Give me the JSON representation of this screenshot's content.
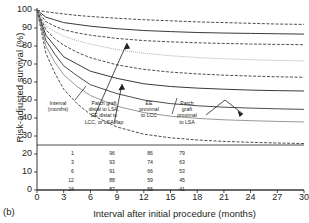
{
  "figure": {
    "panel_letter": "(b)",
    "xlabel": "Interval after initial procedure (months)",
    "ylabel": "Risk-adjusted survival (%)"
  },
  "annotations": {
    "interval_header": "Interval\n(months)",
    "group1": "Patch graft\ndistal to LSA,\nEE distal to\nLCC, or LSA flap",
    "group2": "EE\nproximal\nto LCC",
    "group3": "Patch\ngraft\nproximal\nto LSA"
  },
  "table": {
    "row_labels": [
      "1",
      "3",
      "6",
      "12",
      "24"
    ],
    "columns": [
      {
        "name": "Patch graft distal to LSA, EE distal to LCC, or LSA flap",
        "values": [
          "96",
          "93",
          "91",
          "88",
          "87"
        ]
      },
      {
        "name": "EE proximal to LCC",
        "values": [
          "86",
          "74",
          "66",
          "59",
          "56"
        ]
      },
      {
        "name": "Patch graft proximal to LSA",
        "values": [
          "79",
          "63",
          "53",
          "45",
          "41"
        ]
      }
    ]
  },
  "chart_data": {
    "type": "line",
    "title": "",
    "xlabel": "Interval after initial procedure (months)",
    "ylabel": "Risk-adjusted survival (%)",
    "xlim": [
      0,
      30
    ],
    "ylim": [
      0,
      100
    ],
    "xticks": [
      0,
      3,
      6,
      9,
      12,
      15,
      18,
      21,
      24,
      27,
      30
    ],
    "yticks": [
      0,
      10,
      20,
      30,
      40,
      50,
      60,
      70,
      80,
      90,
      100
    ],
    "grid": false,
    "legend": "in-plot annotations with arrows",
    "x": [
      0,
      1,
      2,
      3,
      4.5,
      6,
      9,
      12,
      15,
      18,
      21,
      24,
      27,
      30
    ],
    "series": [
      {
        "name": "Patch graft distal to LSA, EE distal to LCC, or LSA flap - upper CI",
        "style": "dashed",
        "color": "#4d4d4d",
        "values": [
          100,
          99,
          98.4,
          97.8,
          97.0,
          96.4,
          95.4,
          94.6,
          94.0,
          93.4,
          93.0,
          92.6,
          92.2,
          92.0
        ]
      },
      {
        "name": "Patch graft distal to LSA, EE distal to LCC, or LSA flap - estimate",
        "style": "solid",
        "color": "#3a3a3a",
        "values": [
          100,
          96,
          94.5,
          93,
          92,
          91,
          89.6,
          88.6,
          88.0,
          87.5,
          87.2,
          87.0,
          86.8,
          86.6
        ]
      },
      {
        "name": "Patch graft distal to LSA, EE distal to LCC, or LSA flap - lower CI",
        "style": "dashed",
        "color": "#4d4d4d",
        "values": [
          100,
          93.5,
          91,
          89,
          87.3,
          86,
          84.2,
          83.0,
          82.3,
          81.8,
          81.4,
          81.1,
          80.9,
          80.7
        ]
      },
      {
        "name": "Secondary upper band - dotted",
        "style": "dotted",
        "color": "#8c8c8c",
        "values": [
          100,
          91,
          88,
          85.5,
          83,
          81,
          78,
          76,
          74.6,
          73.6,
          72.9,
          72.4,
          72.0,
          71.7
        ]
      },
      {
        "name": "EE proximal to LCC - upper CI",
        "style": "dashed",
        "color": "#4d4d4d",
        "values": [
          100,
          89,
          84,
          80.5,
          76.5,
          73.5,
          69.5,
          67,
          65.5,
          64.5,
          63.8,
          63.3,
          62.9,
          62.6
        ]
      },
      {
        "name": "EE proximal to LCC - estimate",
        "style": "solid",
        "color": "#3a3a3a",
        "values": [
          100,
          86,
          80,
          74,
          70,
          66,
          62,
          59,
          57.5,
          56.6,
          56.0,
          55.5,
          55.2,
          55.0
        ]
      },
      {
        "name": "EE proximal to LCC - lower CI",
        "style": "solid",
        "color": "#4d4d4d",
        "values": [
          100,
          83,
          75.5,
          69,
          63.5,
          58.5,
          53.5,
          50,
          48,
          46.8,
          46.0,
          45.5,
          45.1,
          44.8
        ]
      },
      {
        "name": "Patch graft proximal to LSA - upper band",
        "style": "solid",
        "color": "#999999",
        "values": [
          100,
          80,
          71,
          64,
          57.5,
          52.5,
          46.5,
          43,
          41,
          39.8,
          39.0,
          38.5,
          38.1,
          37.8
        ]
      },
      {
        "name": "Patch graft proximal to LSA - estimate",
        "style": "dashed",
        "color": "#4d4d4d",
        "values": [
          100,
          76,
          65,
          56,
          48,
          42,
          35,
          31,
          29,
          27.8,
          27.0,
          26.5,
          26.1,
          25.8
        ]
      }
    ],
    "table": {
      "row_header": "Interval (months)",
      "rows": [
        1,
        3,
        6,
        12,
        24
      ],
      "columns": [
        {
          "name": "Patch graft distal to LSA, EE distal to LCC, or LSA flap",
          "values": [
            96,
            93,
            91,
            88,
            87
          ]
        },
        {
          "name": "EE proximal to LCC",
          "values": [
            86,
            74,
            66,
            59,
            56
          ]
        },
        {
          "name": "Patch graft proximal to LSA",
          "values": [
            79,
            63,
            53,
            45,
            41
          ]
        }
      ]
    }
  }
}
